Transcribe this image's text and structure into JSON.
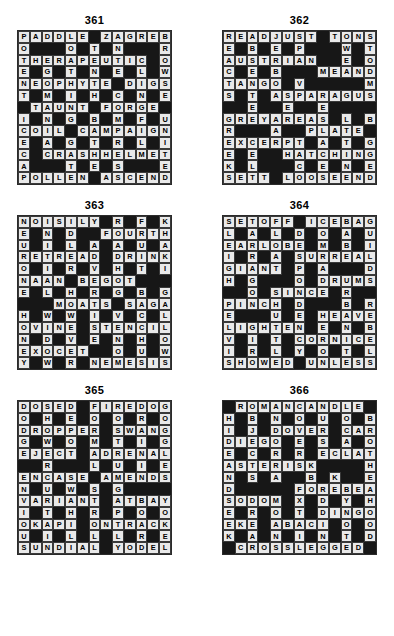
{
  "page": {
    "background_color": "#ffffff",
    "block_color": "#171717",
    "light_cell_color": "#e9e9e9",
    "text_color": "#000000",
    "grid_size": 13,
    "columns": 2,
    "rows": 3
  },
  "puzzles": [
    {
      "number": "361",
      "grid": [
        [
          "P",
          "A",
          "D",
          "D",
          "L",
          "E",
          "",
          "Z",
          "A",
          "G",
          "R",
          "E",
          "B"
        ],
        [
          "O",
          "",
          "",
          "",
          "O",
          "",
          "T",
          "",
          "N",
          "",
          "",
          "",
          "R"
        ],
        [
          "T",
          "H",
          "E",
          "R",
          "A",
          "P",
          "E",
          "U",
          "T",
          "I",
          "C",
          "",
          "O"
        ],
        [
          "E",
          "",
          "G",
          "",
          "T",
          "",
          "N",
          "",
          "E",
          "",
          "L",
          "",
          "W"
        ],
        [
          "N",
          "E",
          "O",
          "P",
          "H",
          "Y",
          "T",
          "E",
          "",
          "D",
          "I",
          "G",
          "S"
        ],
        [
          "T",
          "",
          "M",
          "",
          "I",
          "",
          "H",
          "",
          "C",
          "",
          "N",
          "",
          "E"
        ],
        [
          "",
          "T",
          "A",
          "U",
          "N",
          "T",
          "",
          "F",
          "O",
          "R",
          "G",
          "E",
          ""
        ],
        [
          "I",
          "",
          "N",
          "",
          "G",
          "",
          "B",
          "",
          "M",
          "",
          "F",
          "",
          "U"
        ],
        [
          "C",
          "O",
          "I",
          "L",
          "",
          "C",
          "A",
          "M",
          "P",
          "A",
          "I",
          "G",
          "N"
        ],
        [
          "E",
          "",
          "A",
          "",
          "G",
          "",
          "T",
          "",
          "R",
          "",
          "L",
          "",
          "I"
        ],
        [
          "C",
          "",
          "C",
          "R",
          "A",
          "S",
          "H",
          "H",
          "E",
          "L",
          "M",
          "E",
          "T"
        ],
        [
          "A",
          "",
          "",
          "",
          "T",
          "",
          "E",
          "",
          "S",
          "",
          "",
          "",
          "E"
        ],
        [
          "P",
          "O",
          "L",
          "L",
          "E",
          "N",
          "",
          "A",
          "S",
          "C",
          "E",
          "N",
          "D"
        ]
      ]
    },
    {
      "number": "362",
      "grid": [
        [
          "R",
          "E",
          "A",
          "D",
          "J",
          "U",
          "S",
          "T",
          "",
          "T",
          "O",
          "N",
          "S"
        ],
        [
          "E",
          "",
          "B",
          "",
          "E",
          "",
          "P",
          "",
          "",
          "",
          "W",
          "",
          "T"
        ],
        [
          "A",
          "U",
          "S",
          "T",
          "R",
          "I",
          "A",
          "N",
          "",
          "",
          "E",
          "",
          "O"
        ],
        [
          "C",
          "",
          "E",
          "",
          "B",
          "",
          "",
          "",
          "M",
          "E",
          "A",
          "N",
          "D",
          "E",
          "R"
        ],
        [
          "T",
          "A",
          "N",
          "G",
          "O",
          "",
          "V",
          "",
          "",
          "",
          "",
          "",
          "M"
        ],
        [
          "S",
          "",
          "T",
          "",
          "A",
          "S",
          "P",
          "A",
          "R",
          "A",
          "G",
          "U",
          "S"
        ],
        [
          "",
          "",
          "E",
          "",
          "",
          "E",
          "",
          "",
          "E",
          "",
          "",
          "",
          ""
        ],
        [
          "G",
          "R",
          "E",
          "Y",
          "A",
          "R",
          "E",
          "A",
          "S",
          "",
          "L",
          "",
          "B"
        ],
        [
          "R",
          "",
          "",
          "",
          "A",
          "",
          "",
          "P",
          "L",
          "A",
          "T",
          "E"
        ],
        [
          "E",
          "X",
          "C",
          "E",
          "R",
          "P",
          "T",
          "",
          "A",
          "",
          "T",
          "",
          "G"
        ],
        [
          "E",
          "",
          "E",
          "",
          "",
          "H",
          "A",
          "T",
          "C",
          "H",
          "I",
          "N",
          "G"
        ],
        [
          "K",
          "",
          "L",
          "",
          "",
          "",
          "C",
          "",
          "E",
          "",
          "N",
          "",
          "E"
        ],
        [
          "S",
          "E",
          "T",
          "T",
          "",
          "L",
          "O",
          "O",
          "S",
          "E",
          "E",
          "N",
          "D"
        ]
      ]
    },
    {
      "number": "363",
      "grid": [
        [
          "N",
          "O",
          "I",
          "S",
          "I",
          "L",
          "Y",
          "",
          "R",
          "",
          "F",
          "",
          "K"
        ],
        [
          "E",
          "",
          "N",
          "",
          "D",
          "",
          "",
          "F",
          "O",
          "U",
          "R",
          "T",
          "H"
        ],
        [
          "U",
          "",
          "I",
          "",
          "L",
          "",
          "A",
          "",
          "A",
          "",
          "U",
          "",
          "A"
        ],
        [
          "R",
          "E",
          "T",
          "R",
          "E",
          "A",
          "D",
          "",
          "D",
          "R",
          "I",
          "N",
          "K"
        ],
        [
          "O",
          "",
          "I",
          "",
          "R",
          "",
          "V",
          "",
          "H",
          "",
          "T",
          "",
          "I"
        ],
        [
          "N",
          "A",
          "A",
          "N",
          "",
          "B",
          "E",
          "G",
          "O",
          "T",
          "",
          "",
          ""
        ],
        [
          "E",
          "",
          "L",
          "",
          "H",
          "",
          "R",
          "",
          "G",
          "",
          "B",
          "",
          "G"
        ],
        [
          "",
          "",
          "",
          "M",
          "O",
          "A",
          "T",
          "S",
          "",
          "S",
          "A",
          "G",
          "A"
        ],
        [
          "H",
          "",
          "W",
          "",
          "W",
          "",
          "I",
          "",
          "V",
          "",
          "C",
          "",
          "L"
        ],
        [
          "O",
          "V",
          "I",
          "N",
          "E",
          "",
          "S",
          "T",
          "E",
          "N",
          "C",
          "I",
          "L"
        ],
        [
          "N",
          "",
          "D",
          "",
          "V",
          "",
          "E",
          "",
          "N",
          "",
          "H",
          "",
          "O"
        ],
        [
          "E",
          "X",
          "O",
          "C",
          "E",
          "T",
          "",
          "",
          "O",
          "",
          "U",
          "",
          "W"
        ],
        [
          "Y",
          "",
          "W",
          "",
          "R",
          "",
          "N",
          "E",
          "M",
          "E",
          "S",
          "I",
          "S"
        ]
      ]
    },
    {
      "number": "364",
      "grid": [
        [
          "S",
          "E",
          "T",
          "O",
          "F",
          "F",
          "",
          "I",
          "C",
          "E",
          "B",
          "A",
          "G"
        ],
        [
          "L",
          "",
          "A",
          "",
          "L",
          "",
          "D",
          "",
          "O",
          "",
          "A",
          "",
          "U"
        ],
        [
          "E",
          "A",
          "R",
          "L",
          "O",
          "B",
          "E",
          "",
          "M",
          "",
          "B",
          "",
          "I"
        ],
        [
          "I",
          "",
          "R",
          "",
          "A",
          "",
          "S",
          "U",
          "R",
          "R",
          "E",
          "A",
          "L"
        ],
        [
          "G",
          "I",
          "A",
          "N",
          "T",
          "",
          "P",
          "",
          "A",
          "",
          "",
          "",
          "D"
        ],
        [
          "H",
          "",
          "G",
          "",
          "",
          "",
          "O",
          "",
          "D",
          "R",
          "U",
          "M",
          "S"
        ],
        [
          "",
          "",
          "O",
          "",
          "S",
          "I",
          "N",
          "C",
          "E",
          "",
          "R",
          "",
          ""
        ],
        [
          "P",
          "I",
          "N",
          "C",
          "H",
          "",
          "D",
          "",
          "",
          "",
          "B",
          "",
          "R"
        ],
        [
          "E",
          "",
          "",
          "",
          "U",
          "",
          "E",
          "",
          "H",
          "E",
          "A",
          "V",
          "E"
        ],
        [
          "L",
          "I",
          "G",
          "H",
          "T",
          "E",
          "N",
          "",
          "E",
          "",
          "N",
          "",
          "B"
        ],
        [
          "V",
          "",
          "I",
          "",
          "T",
          "",
          "C",
          "O",
          "R",
          "N",
          "I",
          "C",
          "E"
        ],
        [
          "I",
          "",
          "R",
          "",
          "L",
          "",
          "Y",
          "",
          "O",
          "",
          "T",
          "",
          "L"
        ],
        [
          "S",
          "H",
          "O",
          "W",
          "E",
          "D",
          "",
          "U",
          "N",
          "L",
          "E",
          "S",
          "S"
        ]
      ]
    },
    {
      "number": "365",
      "grid": [
        [
          "D",
          "O",
          "S",
          "E",
          "D",
          "",
          "F",
          "I",
          "R",
          "E",
          "D",
          "O",
          "G"
        ],
        [
          "O",
          "",
          "H",
          "",
          "E",
          "",
          "O",
          "",
          "O",
          "",
          "R",
          "",
          "O"
        ],
        [
          "D",
          "R",
          "O",
          "P",
          "P",
          "E",
          "R",
          "",
          "S",
          "W",
          "A",
          "N",
          "G"
        ],
        [
          "G",
          "",
          "W",
          "",
          "O",
          "",
          "M",
          "",
          "T",
          "",
          "I",
          "",
          "G"
        ],
        [
          "E",
          "J",
          "E",
          "C",
          "T",
          "",
          "A",
          "D",
          "R",
          "E",
          "N",
          "A",
          "L"
        ],
        [
          "",
          "",
          "R",
          "",
          "",
          "",
          "L",
          "",
          "U",
          "",
          "I",
          "",
          "E"
        ],
        [
          "E",
          "N",
          "C",
          "A",
          "S",
          "E",
          "",
          "A",
          "M",
          "E",
          "N",
          "D",
          "S"
        ],
        [
          "N",
          "",
          "U",
          "",
          "W",
          "",
          "S",
          "",
          "G",
          "",
          "",
          "",
          ""
        ],
        [
          "V",
          "A",
          "R",
          "I",
          "A",
          "N",
          "T",
          "",
          "A",
          "T",
          "B",
          "A",
          "Y"
        ],
        [
          "I",
          "",
          "T",
          "",
          "H",
          "",
          "R",
          "",
          "P",
          "",
          "O",
          "",
          "O"
        ],
        [
          "O",
          "K",
          "A",
          "P",
          "I",
          "",
          "O",
          "N",
          "T",
          "R",
          "A",
          "C",
          "K"
        ],
        [
          "U",
          "",
          "I",
          "",
          "L",
          "",
          "L",
          "",
          "L",
          "",
          "R",
          "",
          "E"
        ],
        [
          "S",
          "U",
          "N",
          "D",
          "I",
          "A",
          "L",
          "",
          "Y",
          "O",
          "D",
          "E",
          "L"
        ]
      ]
    },
    {
      "number": "366",
      "grid": [
        [
          "",
          "R",
          "O",
          "M",
          "A",
          "N",
          "C",
          "A",
          "N",
          "D",
          "L",
          "E",
          ""
        ],
        [
          "H",
          "",
          "B",
          "",
          "N",
          "",
          "O",
          "",
          "U",
          "",
          "O",
          "",
          "B"
        ],
        [
          "I",
          "",
          "J",
          "",
          "D",
          "O",
          "V",
          "E",
          "R",
          "",
          "C",
          "A",
          "R"
        ],
        [
          "D",
          "I",
          "E",
          "G",
          "O",
          "",
          "E",
          "",
          "S",
          "",
          "A",
          "",
          "O"
        ],
        [
          "E",
          "",
          "C",
          "",
          "R",
          "",
          "R",
          "",
          "E",
          "C",
          "L",
          "A",
          "T"
        ],
        [
          "A",
          "S",
          "T",
          "E",
          "R",
          "I",
          "S",
          "K",
          "",
          "",
          "",
          "",
          "H"
        ],
        [
          "N",
          "",
          "S",
          "",
          "A",
          "",
          "",
          "B",
          "",
          "K",
          "",
          "",
          "E"
        ],
        [
          "D",
          "",
          "",
          "",
          "",
          "",
          "F",
          "O",
          "R",
          "E",
          "B",
          "E",
          "A",
          "R"
        ],
        [
          "S",
          "O",
          "D",
          "O",
          "M",
          "",
          "X",
          "",
          "D",
          "",
          "Y",
          "",
          "H"
        ],
        [
          "E",
          "",
          "R",
          "",
          "O",
          "",
          "T",
          "",
          "D",
          "I",
          "N",
          "G",
          "O"
        ],
        [
          "E",
          "K",
          "E",
          "",
          "A",
          "B",
          "A",
          "C",
          "I",
          "",
          "O",
          "",
          "O"
        ],
        [
          "K",
          "",
          "A",
          "",
          "N",
          "",
          "I",
          "",
          "N",
          "",
          "T",
          "",
          "D"
        ],
        [
          "",
          "C",
          "R",
          "O",
          "S",
          "S",
          "L",
          "E",
          "G",
          "G",
          "E",
          "D",
          ""
        ]
      ]
    }
  ]
}
